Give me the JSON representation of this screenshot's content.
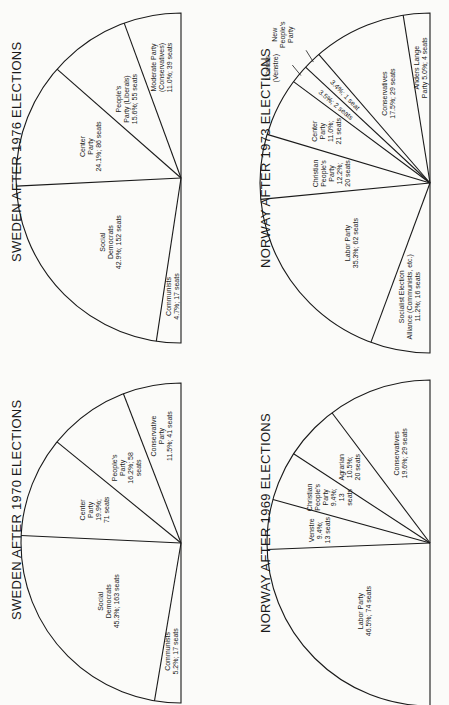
{
  "chart_data": [
    {
      "type": "pie",
      "variant": "semicircle",
      "title": "SWEDEN AFTER 1976 ELECTIONS",
      "position": "top-left",
      "slices": [
        {
          "name": "Communists",
          "percent": 4.7,
          "seats": 17,
          "label_lines": [
            "Communists",
            "4.7%; 17 seats"
          ]
        },
        {
          "name": "Social Democrats",
          "percent": 42.9,
          "seats": 152,
          "label_lines": [
            "Social",
            "Democrats",
            "42.9%; 152 seats"
          ]
        },
        {
          "name": "Center Party",
          "percent": 24.1,
          "seats": 86,
          "label_lines": [
            "Center",
            "Party",
            "24.1%; 86 seats"
          ]
        },
        {
          "name": "People's Party (Liberals)",
          "percent": 15.6,
          "seats": 55,
          "label_lines": [
            "People's",
            "Party (Liberals)",
            "15.6%; 55 seats"
          ]
        },
        {
          "name": "Moderate Party (Conservatives)",
          "percent": 11.0,
          "seats": 39,
          "label_lines": [
            "Moderate Party",
            "(Conservatives)",
            "11.0%; 39 seats"
          ]
        }
      ]
    },
    {
      "type": "pie",
      "variant": "semicircle",
      "title": "NORWAY AFTER 1973 ELECTIONS",
      "position": "top-right",
      "slices": [
        {
          "name": "Socialist Election Alliance (Communists, etc.)",
          "percent": 11.2,
          "seats": 16,
          "label_lines": [
            "Socialist Election",
            "Alliance (Communists, etc.)",
            "11.2%; 16 seats"
          ]
        },
        {
          "name": "Labor Party",
          "percent": 35.3,
          "seats": 62,
          "label_lines": [
            "Labor Party",
            "35.3%; 62 seats"
          ]
        },
        {
          "name": "Christian People's Party",
          "percent": 12.2,
          "seats": 20,
          "label_lines": [
            "Christian",
            "People's",
            "Party",
            "12.2%;",
            "20 seats"
          ]
        },
        {
          "name": "Center Party",
          "percent": 11.0,
          "seats": 21,
          "label_lines": [
            "Center",
            "Party",
            "11.0%;",
            "21 seats"
          ]
        },
        {
          "name": "Liberals (Venstre)",
          "percent": 3.5,
          "seats": 2,
          "label_lines": [
            "3.5%; 2 seats"
          ],
          "callout": [
            "Liberals",
            "(Venstre)"
          ]
        },
        {
          "name": "New People's Party",
          "percent": 3.4,
          "seats": 1,
          "label_lines": [
            "3.4%; 1 seat"
          ],
          "callout": [
            "New",
            "People's",
            "Party"
          ]
        },
        {
          "name": "Conservatives",
          "percent": 17.5,
          "seats": 29,
          "label_lines": [
            "Conservatives",
            "17.5%; 29 seats"
          ]
        },
        {
          "name": "Anders Lange Party",
          "percent": 5.0,
          "seats": 4,
          "label_lines": [
            "Anders Lange",
            "Party 5.0%; 4 seats"
          ]
        }
      ]
    },
    {
      "type": "pie",
      "variant": "semicircle",
      "title": "SWEDEN AFTER 1970 ELECTIONS",
      "position": "bottom-left",
      "slices": [
        {
          "name": "Communists",
          "percent": 5.2,
          "seats": 17,
          "label_lines": [
            "Communists",
            "5.2%; 17 seats"
          ]
        },
        {
          "name": "Social Democrats",
          "percent": 45.3,
          "seats": 163,
          "label_lines": [
            "Social",
            "Democrats",
            "45.3%; 163 seats"
          ]
        },
        {
          "name": "Center Party",
          "percent": 19.9,
          "seats": 71,
          "label_lines": [
            "Center",
            "Party",
            "19.9%;",
            "71 seats"
          ]
        },
        {
          "name": "People's Party",
          "percent": 16.2,
          "seats": 58,
          "label_lines": [
            "People's",
            "Party",
            "16.2%; 58",
            "seats"
          ]
        },
        {
          "name": "Conservative Party",
          "percent": 11.5,
          "seats": 41,
          "label_lines": [
            "Conservative",
            "Party",
            "11.5%; 41 seats"
          ]
        }
      ]
    },
    {
      "type": "pie",
      "variant": "semicircle",
      "title": "NORWAY AFTER 1969 ELECTIONS",
      "position": "bottom-right",
      "slices": [
        {
          "name": "Labor Party",
          "percent": 46.5,
          "seats": 74,
          "label_lines": [
            "Labor Party",
            "46.5%; 74 seats"
          ]
        },
        {
          "name": "Venstre",
          "percent": 9.4,
          "seats": 13,
          "label_lines": [
            "Venstre",
            "9.4%;",
            "13 seats"
          ]
        },
        {
          "name": "Christian People's Party",
          "percent": 9.4,
          "seats": 13,
          "label_lines": [
            "Christian",
            "People's",
            "Party",
            "9.4%;",
            "13",
            "seats"
          ]
        },
        {
          "name": "Agrarian",
          "percent": 10.5,
          "seats": 20,
          "label_lines": [
            "Agrarian",
            "10.5%;",
            "20 seats"
          ]
        },
        {
          "name": "Conservatives",
          "percent": 19.6,
          "seats": 29,
          "label_lines": [
            "Conservatives",
            "19.6%; 29 seats"
          ]
        }
      ]
    }
  ],
  "layout": {
    "charts": [
      {
        "cx": 181,
        "cy": 178,
        "r": 165,
        "title_x": 9,
        "title_y": 262
      },
      {
        "cx": 430,
        "cy": 183,
        "r": 170,
        "title_x": 258,
        "title_y": 268
      },
      {
        "cx": 181,
        "cy": 543,
        "r": 160,
        "title_x": 9,
        "title_y": 620
      },
      {
        "cx": 430,
        "cy": 543,
        "r": 163,
        "title_x": 258,
        "title_y": 633
      }
    ],
    "colors": {
      "ink": "#1a1a1a",
      "paper": "#fbfbf9"
    }
  }
}
